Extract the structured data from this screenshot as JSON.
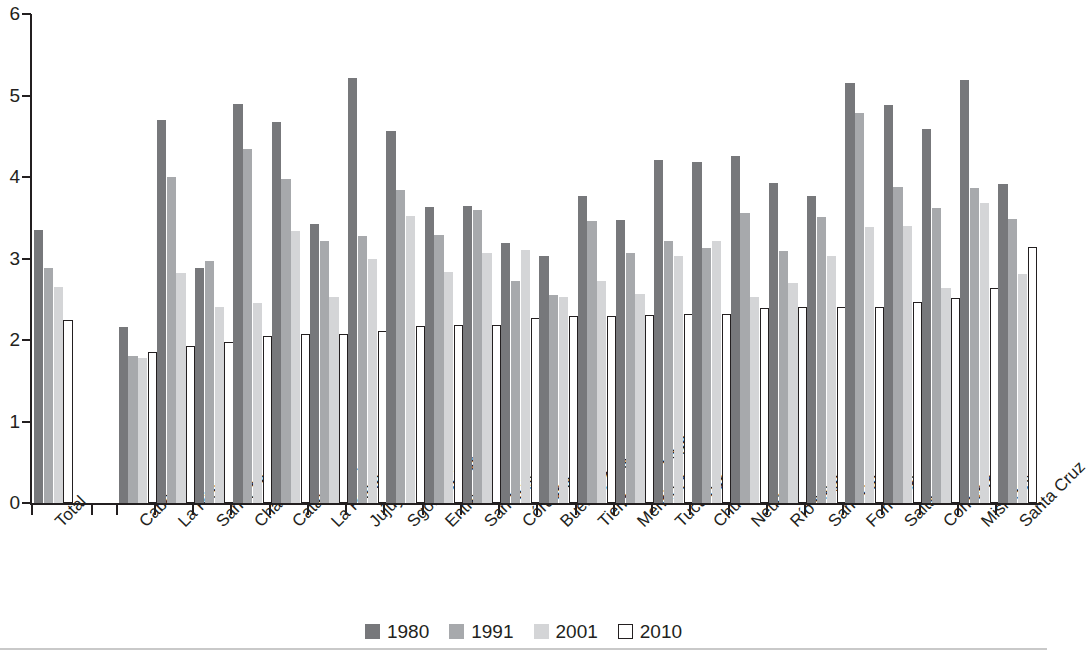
{
  "chart_data": {
    "type": "bar",
    "title": "",
    "subtitle": "",
    "xlabel": "",
    "ylabel": "",
    "ylim": [
      0,
      6
    ],
    "yticks": [
      "0",
      "1",
      "2",
      "3",
      "4",
      "5",
      "6"
    ],
    "grid": false,
    "legend_position": "bottom",
    "orientation": "vertical",
    "separator_after_first_category": true,
    "categories": [
      "Total",
      "Caba",
      "La Rioja",
      "Santa Fe",
      "Chaco",
      "Catamarca",
      "La Pampa",
      "Jujuy",
      "Sgo. del Estero",
      "Entre Ríos",
      "San Luis",
      "Córdoba",
      "Buenos Aires",
      "Tierra del Fuego",
      "Mendoza",
      "Tucumán",
      "Chubut",
      "Neuquén",
      "Río Negro",
      "San Juan",
      "Formosa",
      "Salta",
      "Corrientes",
      "Misiones",
      "Santa Cruz"
    ],
    "series": [
      {
        "name": "1980",
        "color": "#77787b",
        "values": [
          3.35,
          2.16,
          4.7,
          2.88,
          4.89,
          4.68,
          3.42,
          5.22,
          4.57,
          3.63,
          3.65,
          3.19,
          3.03,
          3.77,
          3.47,
          4.21,
          4.18,
          4.26,
          3.93,
          3.77,
          5.15,
          4.88,
          4.59,
          5.19,
          3.91
        ]
      },
      {
        "name": "1991",
        "color": "#a7a9ac",
        "values": [
          2.88,
          1.8,
          4.0,
          2.97,
          4.34,
          3.97,
          3.21,
          3.28,
          3.84,
          3.29,
          3.6,
          2.73,
          2.55,
          3.46,
          3.07,
          3.22,
          3.13,
          3.56,
          3.09,
          3.51,
          4.78,
          3.88,
          3.62,
          3.87,
          3.48
        ]
      },
      {
        "name": "2001",
        "color": "#d4d5d7",
        "values": [
          2.65,
          1.78,
          2.82,
          2.41,
          2.46,
          3.34,
          2.53,
          2.99,
          3.52,
          2.83,
          3.07,
          3.11,
          2.53,
          2.72,
          2.57,
          3.03,
          3.21,
          2.53,
          2.7,
          3.03,
          3.39,
          3.4,
          2.64,
          3.68,
          2.81
        ]
      },
      {
        "name": "2010",
        "color": "#ffffff",
        "values": [
          2.24,
          1.85,
          1.93,
          1.98,
          2.05,
          2.07,
          2.07,
          2.11,
          2.17,
          2.19,
          2.18,
          2.27,
          2.29,
          2.3,
          2.31,
          2.32,
          2.32,
          2.39,
          2.41,
          2.41,
          2.41,
          2.47,
          2.51,
          2.64,
          3.14
        ]
      }
    ],
    "legend": [
      {
        "label": "1980",
        "swatch": "s1980"
      },
      {
        "label": "1991",
        "swatch": "s1991"
      },
      {
        "label": "2001",
        "swatch": "s2001"
      },
      {
        "label": "2010",
        "swatch": "s2010"
      }
    ]
  }
}
